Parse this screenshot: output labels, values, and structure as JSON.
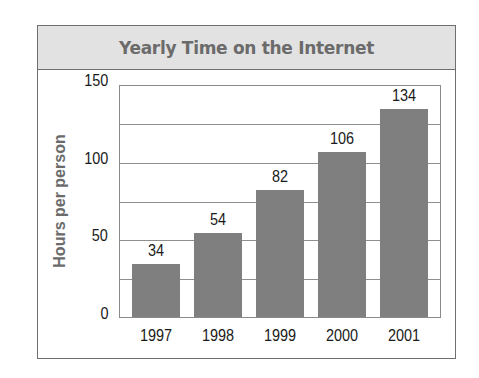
{
  "title": "Yearly Time on the Internet",
  "chart_data": {
    "type": "bar",
    "title": "Yearly Time on the Internet",
    "xlabel": "",
    "ylabel": "Hours per person",
    "categories": [
      "1997",
      "1998",
      "1999",
      "2000",
      "2001"
    ],
    "values": [
      34,
      54,
      82,
      106,
      134
    ],
    "data_labels": [
      "34",
      "54",
      "82",
      "106",
      "134"
    ],
    "ylim": [
      0,
      150
    ],
    "y_ticks": [
      "0",
      "50",
      "100",
      "150"
    ],
    "gridlines_every": 25,
    "grid": true,
    "legend": null,
    "colors": {
      "bar": "#7f7f7f",
      "header_bg": "#e2e2e2",
      "title_text": "#6b6b6b",
      "border": "#6f6f6f"
    }
  }
}
